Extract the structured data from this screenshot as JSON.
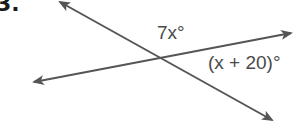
{
  "problem": {
    "number": "3."
  },
  "figure": {
    "type": "intersecting-lines",
    "line_color": "#555555",
    "lines": [
      {
        "name": "line-1",
        "from": [
          57,
          0
        ],
        "to": [
          275,
          122
        ],
        "arrows": "both"
      },
      {
        "name": "line-2",
        "from": [
          32,
          82
        ],
        "to": [
          293,
          33
        ],
        "arrows": "both"
      }
    ],
    "intersection": [
      163,
      59
    ],
    "angles": [
      {
        "label": "7x°",
        "var": "7x",
        "position": "above intersection (between lines, top)"
      },
      {
        "label": "(x + 20)°",
        "var": "(x + 20)",
        "position": "right of intersection (between lines, right)"
      }
    ]
  },
  "labels": {
    "angle_top": "7x°",
    "angle_right": "(x + 20)°"
  }
}
